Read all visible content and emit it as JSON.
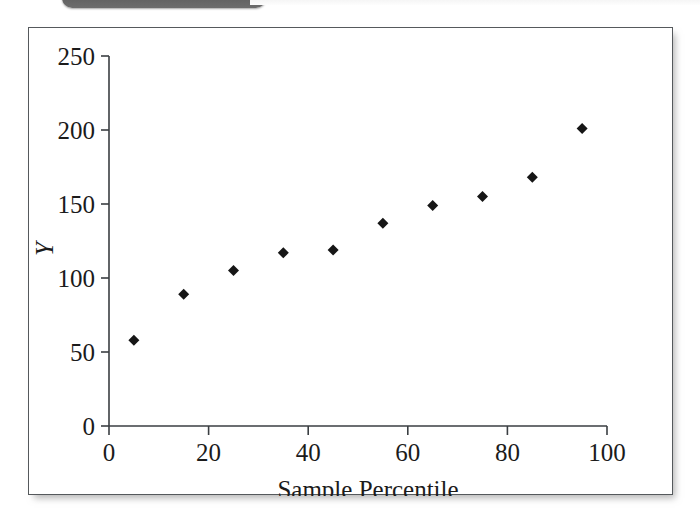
{
  "figure": {
    "top_tab": {
      "label": ""
    },
    "background_color": "#ffffff",
    "frame_color": "#55595c"
  },
  "chart_data": {
    "type": "scatter",
    "title": "",
    "subtitle": "",
    "xlabel": "Sample Percentile",
    "ylabel": "Y",
    "xlim": [
      0,
      100
    ],
    "ylim": [
      0,
      250
    ],
    "xticks": [
      0,
      20,
      40,
      60,
      80,
      100
    ],
    "yticks": [
      0,
      50,
      100,
      150,
      200,
      250
    ],
    "xtick_labels": [
      "0",
      "20",
      "40",
      "60",
      "80",
      "100"
    ],
    "ytick_labels": [
      "0",
      "50",
      "100",
      "150",
      "200",
      "250"
    ],
    "grid": false,
    "legend": null,
    "marker": {
      "shape": "diamond",
      "color": "#161616",
      "size": 11
    },
    "series": [
      {
        "name": "Y vs Sample Percentile",
        "x": [
          5,
          15,
          25,
          35,
          45,
          55,
          65,
          75,
          85,
          95
        ],
        "values": [
          58,
          89,
          105,
          117,
          119,
          137,
          149,
          155,
          168,
          201
        ]
      }
    ]
  }
}
